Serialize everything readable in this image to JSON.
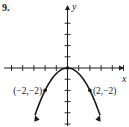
{
  "problem_number": "9.",
  "chart_data": {
    "type": "line",
    "title": "",
    "xlabel": "x",
    "ylabel": "y",
    "xlim": [
      -6,
      5
    ],
    "ylim": [
      -5,
      5
    ],
    "x_ticks": [
      -5,
      -4,
      -3,
      -2,
      -1,
      1,
      2,
      3,
      4,
      5
    ],
    "y_ticks": [
      -5,
      -4,
      -3,
      -2,
      -1,
      1,
      2,
      3,
      4
    ],
    "grid": false,
    "series": [
      {
        "name": "parabola",
        "equation": "y = -x^2/2",
        "x": [
          -2.9,
          -2,
          -1,
          0,
          1,
          2,
          2.9
        ],
        "y": [
          -4.2,
          -2,
          -0.5,
          0,
          -0.5,
          -2,
          -4.2
        ],
        "arrows": "both-ends"
      }
    ],
    "points": [
      {
        "x": -2,
        "y": -2,
        "label": "(−2,−2)"
      },
      {
        "x": 0,
        "y": 0,
        "label": ""
      },
      {
        "x": 2,
        "y": -2,
        "label": "(2,−2)"
      }
    ]
  }
}
